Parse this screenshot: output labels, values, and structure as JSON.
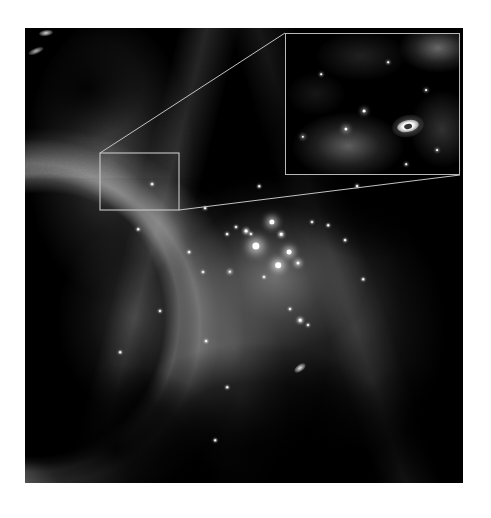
{
  "figure": {
    "kind": "astronomical-image",
    "background_color": "#ffffff",
    "sky_color": "#000000",
    "annotation_color": "#c3c3c3"
  },
  "main_image": {
    "name": "nebula-field",
    "x": 25,
    "y": 28,
    "width": 438,
    "height": 455
  },
  "inset": {
    "name": "magnified-proplyd-inset",
    "x": 285,
    "y": 33,
    "width": 175,
    "height": 142,
    "border_color": "#b9b9b9",
    "object": {
      "name": "proplyd",
      "x": 111,
      "y": 86,
      "width": 22,
      "height": 12,
      "rotation_deg": -12
    }
  },
  "source_box": {
    "name": "inset-source-region",
    "x": 100,
    "y": 153,
    "width": 79,
    "height": 57,
    "stroke": "#c9c9c9"
  },
  "leader_lines": [
    {
      "name": "leader-top",
      "x1": 100,
      "y1": 153,
      "x2": 285,
      "y2": 33
    },
    {
      "name": "leader-bottom",
      "x1": 179,
      "y1": 210,
      "x2": 460,
      "y2": 175
    }
  ],
  "stars": [
    {
      "x": 272,
      "y": 222,
      "r": 2.6,
      "glow": 7
    },
    {
      "x": 281,
      "y": 234,
      "r": 1.3,
      "glow": 3
    },
    {
      "x": 256,
      "y": 246,
      "r": 3.6,
      "glow": 10
    },
    {
      "x": 289,
      "y": 252,
      "r": 2.4,
      "glow": 6
    },
    {
      "x": 278,
      "y": 265,
      "r": 2.8,
      "glow": 7
    },
    {
      "x": 298,
      "y": 263,
      "r": 1.5,
      "glow": 4
    },
    {
      "x": 246,
      "y": 231,
      "r": 1.4,
      "glow": 3
    },
    {
      "x": 251,
      "y": 234,
      "r": 1.1,
      "glow": 2
    },
    {
      "x": 236,
      "y": 227,
      "r": 1.0,
      "glow": 2
    },
    {
      "x": 227,
      "y": 234,
      "r": 0.9,
      "glow": 2
    },
    {
      "x": 264,
      "y": 277,
      "r": 1.0,
      "glow": 2
    },
    {
      "x": 230,
      "y": 272,
      "r": 1.2,
      "glow": 3
    },
    {
      "x": 312,
      "y": 222,
      "r": 1.0,
      "glow": 2
    },
    {
      "x": 345,
      "y": 240,
      "r": 0.9,
      "glow": 2
    },
    {
      "x": 357,
      "y": 186,
      "r": 0.9,
      "glow": 2
    },
    {
      "x": 300,
      "y": 320,
      "r": 1.3,
      "glow": 3
    },
    {
      "x": 308,
      "y": 325,
      "r": 1.0,
      "glow": 2
    },
    {
      "x": 203,
      "y": 272,
      "r": 1.0,
      "glow": 2
    },
    {
      "x": 189,
      "y": 252,
      "r": 0.9,
      "glow": 2
    },
    {
      "x": 152,
      "y": 184,
      "r": 0.9,
      "glow": 2
    },
    {
      "x": 205,
      "y": 208,
      "r": 0.9,
      "glow": 2
    },
    {
      "x": 160,
      "y": 311,
      "r": 1.0,
      "glow": 2
    },
    {
      "x": 206,
      "y": 341,
      "r": 0.9,
      "glow": 2
    },
    {
      "x": 120,
      "y": 352,
      "r": 0.8,
      "glow": 2
    },
    {
      "x": 227,
      "y": 387,
      "r": 0.8,
      "glow": 2
    },
    {
      "x": 215,
      "y": 440,
      "r": 0.8,
      "glow": 2
    },
    {
      "x": 328,
      "y": 225,
      "r": 0.8,
      "glow": 2
    },
    {
      "x": 363,
      "y": 279,
      "r": 0.8,
      "glow": 2
    },
    {
      "x": 259,
      "y": 186,
      "r": 0.8,
      "glow": 2
    },
    {
      "x": 290,
      "y": 309,
      "r": 1.0,
      "glow": 2
    },
    {
      "x": 138,
      "y": 229,
      "r": 0.8,
      "glow": 2
    }
  ],
  "knots": [
    {
      "name": "knot-top-left-a",
      "x": 46,
      "y": 33,
      "w": 14,
      "h": 6,
      "rot": -8,
      "bright": 0.85
    },
    {
      "name": "knot-top-left-b",
      "x": 36,
      "y": 51,
      "w": 16,
      "h": 6,
      "rot": -22,
      "bright": 0.72
    },
    {
      "name": "knot-south-bright",
      "x": 300,
      "y": 368,
      "w": 13,
      "h": 7,
      "rot": -35,
      "bright": 0.9
    },
    {
      "name": "knot-inset-top-right",
      "x": 430,
      "y": 44,
      "w": 24,
      "h": 10,
      "rot": -20,
      "bright": 0.5
    }
  ],
  "inset_stars": [
    {
      "x": 60,
      "y": 95,
      "r": 1.6
    },
    {
      "x": 78,
      "y": 77,
      "r": 1.4
    },
    {
      "x": 17,
      "y": 103,
      "r": 1.2
    },
    {
      "x": 140,
      "y": 56,
      "r": 0.9
    },
    {
      "x": 151,
      "y": 116,
      "r": 0.9
    },
    {
      "x": 102,
      "y": 28,
      "r": 0.8
    },
    {
      "x": 35,
      "y": 40,
      "r": 0.8
    },
    {
      "x": 120,
      "y": 130,
      "r": 0.8
    }
  ]
}
